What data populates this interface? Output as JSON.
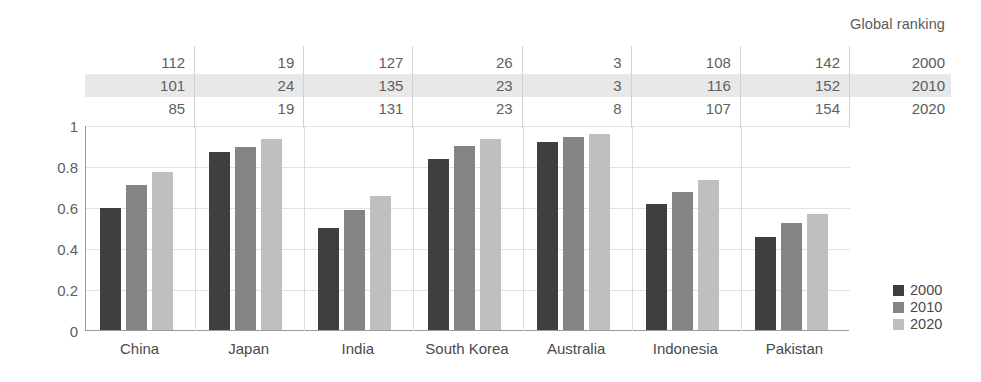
{
  "chart_data": {
    "type": "bar",
    "title": "",
    "subtitle": "",
    "xlabel": "",
    "ylabel": "",
    "ylim": [
      0,
      1
    ],
    "yticks": [
      "0",
      "0.2",
      "0.4",
      "0.6",
      "0.8",
      "1"
    ],
    "ytick_values": [
      0,
      0.2,
      0.4,
      0.6,
      0.8,
      1
    ],
    "grid": true,
    "legend_position": "right",
    "categories": [
      "China",
      "Japan",
      "India",
      "South Korea",
      "Australia",
      "Indonesia",
      "Pakistan"
    ],
    "series": [
      {
        "name": "2000",
        "color": "#3f3f3f",
        "values": [
          0.595,
          0.87,
          0.5,
          0.835,
          0.915,
          0.615,
          0.455
        ]
      },
      {
        "name": "2010",
        "color": "#848484",
        "values": [
          0.705,
          0.895,
          0.585,
          0.9,
          0.94,
          0.675,
          0.52
        ]
      },
      {
        "name": "2020",
        "color": "#bfbfbf",
        "values": [
          0.77,
          0.93,
          0.655,
          0.93,
          0.955,
          0.73,
          0.565
        ]
      }
    ],
    "annotations": {
      "table_title": "Global ranking",
      "table_row_labels": [
        "2000",
        "2010",
        "2020"
      ],
      "table_values": [
        {
          "country": "China",
          "2000": "112",
          "2010": "101",
          "2020": "85"
        },
        {
          "country": "Japan",
          "2000": "19",
          "2010": "24",
          "2020": "19"
        },
        {
          "country": "India",
          "2000": "127",
          "2010": "135",
          "2020": "131"
        },
        {
          "country": "South Korea",
          "2000": "26",
          "2010": "23",
          "2020": "23"
        },
        {
          "country": "Australia",
          "2000": "3",
          "2010": "3",
          "2020": "8"
        },
        {
          "country": "Indonesia",
          "2000": "108",
          "2010": "116",
          "2020": "107"
        },
        {
          "country": "Pakistan",
          "2000": "142",
          "2010": "152",
          "2020": "154"
        }
      ]
    }
  },
  "ranking_table": {
    "header": "Global ranking",
    "years": [
      "2000",
      "2010",
      "2020"
    ],
    "rows": [
      [
        "112",
        "19",
        "127",
        "26",
        "3",
        "108",
        "142"
      ],
      [
        "101",
        "24",
        "135",
        "23",
        "3",
        "116",
        "152"
      ],
      [
        "85",
        "19",
        "131",
        "23",
        "8",
        "107",
        "154"
      ]
    ]
  },
  "legend": {
    "items": [
      {
        "label": "2000",
        "color": "#3f3f3f"
      },
      {
        "label": "2010",
        "color": "#848484"
      },
      {
        "label": "2020",
        "color": "#bfbfbf"
      }
    ]
  },
  "axis": {
    "y_ticks": [
      "0",
      "0.2",
      "0.4",
      "0.6",
      "0.8",
      "1"
    ],
    "x_labels": [
      "China",
      "Japan",
      "India",
      "South Korea",
      "Australia",
      "Indonesia",
      "Pakistan"
    ]
  },
  "colors": {
    "series_2000": "#3f3f3f",
    "series_2010": "#848484",
    "series_2020": "#bfbfbf",
    "highlight_band": "#e8e8e8",
    "gridline": "#e2e2e2",
    "axis": "#9a9a9a",
    "text": "#4a4a4a"
  }
}
